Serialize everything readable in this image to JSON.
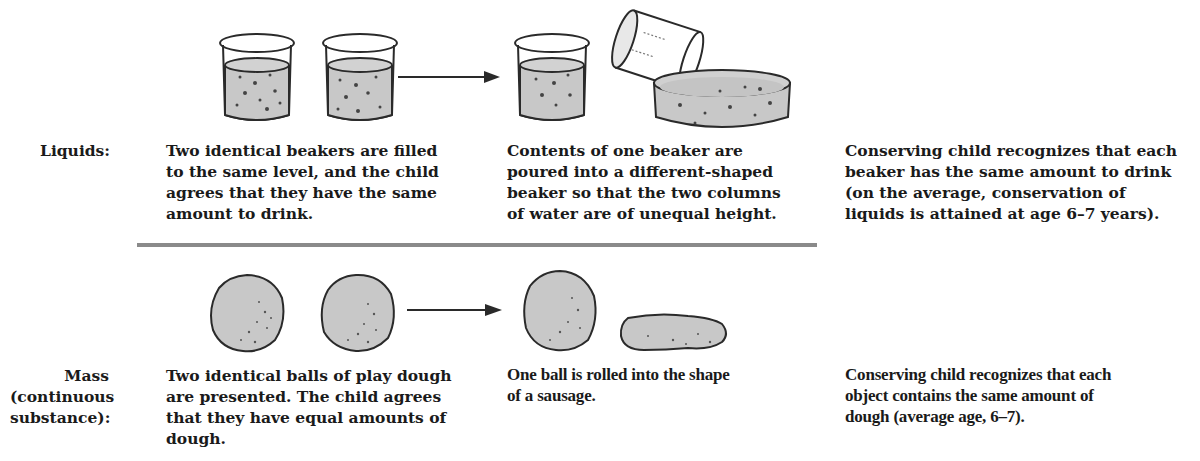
{
  "figure": {
    "rows": [
      {
        "label": "Liquids:",
        "step1": "Two identical beakers are filled\nto the same level, and the child\nagrees that they have the same\namount to drink.",
        "step2": "Contents of one beaker are\npoured into a different-shaped\nbeaker so that the two columns\nof water are of unequal height.",
        "result": "Conserving child recognizes that each\nbeaker has the same amount to drink\n(on the average, conservation of\nliquids is attained at age 6–7 years).",
        "illustrations": {
          "before": [
            "beaker-filled",
            "beaker-filled"
          ],
          "after": [
            "beaker-filled",
            "tilted-beaker-pouring",
            "wide-shallow-dish"
          ]
        }
      },
      {
        "label": "Mass\n(continuous\nsubstance):",
        "step1": "Two identical balls of play dough\nare presented. The child agrees\nthat they have equal amounts of\ndough.",
        "step2": "One ball is rolled into the shape\nof a sausage.",
        "result": "Conserving child recognizes that each\nobject contains the same amount of\ndough (average age, 6–7).",
        "illustrations": {
          "before": [
            "dough-ball",
            "dough-ball"
          ],
          "after": [
            "dough-ball",
            "dough-sausage"
          ]
        }
      }
    ],
    "colors": {
      "fill": "#c8c8c8",
      "outline": "#2a2a2a",
      "divider": "#8a8a8a",
      "text": "#1a1a1a"
    }
  }
}
